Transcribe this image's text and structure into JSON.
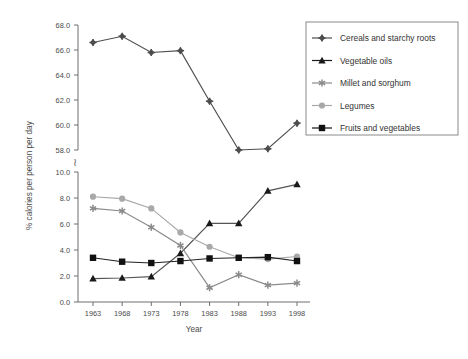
{
  "chart_data": {
    "type": "line",
    "title": "",
    "xlabel": "Year",
    "ylabel": "% calories per person per day",
    "x": [
      1963,
      1968,
      1973,
      1978,
      1983,
      1988,
      1993,
      1998
    ],
    "categories": [
      "1963",
      "1968",
      "1973",
      "1978",
      "1983",
      "1988",
      "1993",
      "1998"
    ],
    "xlim": [
      1960.5,
      2000.5
    ],
    "grid": false,
    "legend_position": "right",
    "broken_axis": true,
    "axis_break_symbol": "≀",
    "panels": [
      {
        "name": "upper",
        "ylim": [
          58.0,
          68.0
        ],
        "yticks": [
          58.0,
          60.0,
          62.0,
          64.0,
          66.0,
          68.0
        ],
        "ytick_labels": [
          "58.0",
          "60.0",
          "62.0",
          "64.0",
          "66.0",
          "68.0"
        ]
      },
      {
        "name": "lower",
        "ylim": [
          0.0,
          10.0
        ],
        "yticks": [
          0.0,
          2.0,
          4.0,
          6.0,
          8.0,
          10.0
        ],
        "ytick_labels": [
          "0.0",
          "2.0",
          "4.0",
          "6.0",
          "8.0",
          "10.0"
        ]
      }
    ],
    "series": [
      {
        "name": "Cereals and starchy roots",
        "panel": "upper",
        "marker": "star-diamond",
        "color": "#4d4d4d",
        "line_color": "#4d4d4d",
        "values": [
          66.6,
          67.1,
          65.8,
          65.95,
          61.9,
          58.0,
          58.1,
          60.15
        ]
      },
      {
        "name": "Vegetable oils",
        "panel": "lower",
        "marker": "triangle",
        "color": "#1a1a1a",
        "line_color": "#555555",
        "values": [
          1.8,
          1.85,
          1.95,
          3.75,
          6.05,
          6.05,
          8.55,
          9.05
        ]
      },
      {
        "name": "Millet and sorghum",
        "panel": "lower",
        "marker": "asterisk",
        "color": "#8a8a8a",
        "line_color": "#8a8a8a",
        "values": [
          7.2,
          7.0,
          5.75,
          4.35,
          1.1,
          2.1,
          1.3,
          1.45
        ]
      },
      {
        "name": "Legumes",
        "panel": "lower",
        "marker": "circle",
        "color": "#a8a8a8",
        "line_color": "#a8a8a8",
        "values": [
          8.1,
          7.95,
          7.2,
          5.35,
          4.25,
          3.4,
          3.3,
          3.5
        ]
      },
      {
        "name": "Fruits and vegetables",
        "panel": "lower",
        "marker": "square",
        "color": "#111111",
        "line_color": "#222222",
        "values": [
          3.4,
          3.1,
          3.0,
          3.15,
          3.35,
          3.4,
          3.45,
          3.15
        ]
      }
    ]
  },
  "axes": {
    "y_title": "% calories per person per day",
    "x_title": "Year",
    "break_symbol": "≀",
    "upper_ticks": [
      "68.0",
      "66.0",
      "64.0",
      "62.0",
      "60.0",
      "58.0"
    ],
    "lower_ticks": [
      "10.0",
      "8.0",
      "6.0",
      "4.0",
      "2.0",
      "0.0"
    ],
    "x_ticks": [
      "1963",
      "1968",
      "1973",
      "1978",
      "1983",
      "1988",
      "1993",
      "1998"
    ]
  },
  "legend": {
    "items": [
      {
        "label": "Cereals and starchy roots",
        "marker": "star-diamond",
        "color": "#4d4d4d"
      },
      {
        "label": "Vegetable oils",
        "marker": "triangle",
        "color": "#1a1a1a"
      },
      {
        "label": "Millet and sorghum",
        "marker": "asterisk",
        "color": "#8a8a8a"
      },
      {
        "label": "Legumes",
        "marker": "circle",
        "color": "#a8a8a8"
      },
      {
        "label": "Fruits and vegetables",
        "marker": "square",
        "color": "#111111"
      }
    ]
  }
}
